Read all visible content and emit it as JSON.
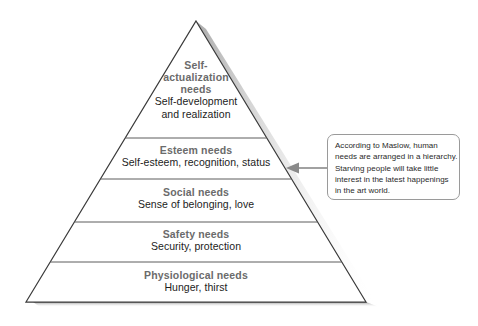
{
  "diagram": {
    "type": "maslow-hierarchy-of-needs-pyramid",
    "tiers": [
      {
        "id": "self-actualization",
        "title": "Self-\nactualization\nneeds",
        "title_lines": [
          "Self-",
          "actualization",
          "needs"
        ],
        "desc_lines": [
          "Self-development",
          "and realization"
        ],
        "level": 5
      },
      {
        "id": "esteem",
        "title": "Esteem needs",
        "title_lines": [
          "Esteem needs"
        ],
        "desc_lines": [
          "Self-esteem, recognition, status"
        ],
        "level": 4
      },
      {
        "id": "social",
        "title": "Social needs",
        "title_lines": [
          "Social needs"
        ],
        "desc_lines": [
          "Sense of belonging, love"
        ],
        "level": 3
      },
      {
        "id": "safety",
        "title": "Safety needs",
        "title_lines": [
          "Safety needs"
        ],
        "desc_lines": [
          "Security, protection"
        ],
        "level": 2
      },
      {
        "id": "physiological",
        "title": "Physiological needs",
        "title_lines": [
          "Physiological needs"
        ],
        "desc_lines": [
          "Hunger, thirst"
        ],
        "level": 1
      }
    ]
  },
  "callout": {
    "lines": [
      "According to Maslow, human",
      "needs are arranged in a hierarchy.",
      "Starving people will take little",
      "interest in the latest happenings",
      "in the art world."
    ],
    "full_text": "According to Maslow, human needs are arranged in a hierarchy. Starving people will take little interest in the latest happenings in the art world.",
    "points_to": "esteem"
  },
  "colors": {
    "background": "#ffffff",
    "outline": "#3a3a3a",
    "divider": "#5c5c5c",
    "heading_text": "#6b6b6b",
    "body_text": "#1c1c1c",
    "callout_border": "#9a9a9a",
    "callout_text": "#2a2a2a",
    "arrow": "#8a8a8a",
    "shadow": "#b9b9b9"
  },
  "tier_titles": {
    "self_l1": "Self-",
    "self_l2": "actualization",
    "self_l3": "needs",
    "esteem": "Esteem needs",
    "social": "Social needs",
    "safety": "Safety needs",
    "physiological": "Physiological needs"
  },
  "tier_descs": {
    "self_l1": "Self-development",
    "self_l2": "and realization",
    "esteem": "Self-esteem, recognition, status",
    "social": "Sense of belonging, love",
    "safety": "Security, protection",
    "physiological": "Hunger, thirst"
  },
  "callout_lines": {
    "l1": "According to Maslow, human",
    "l2": "needs are arranged in a hierarchy.",
    "l3": "Starving people will take little",
    "l4": "interest in the latest happenings",
    "l5": "in the art world."
  }
}
